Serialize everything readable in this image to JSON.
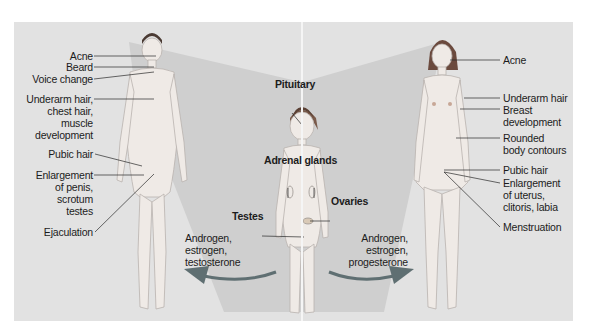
{
  "diagram": {
    "title": "",
    "male": {
      "labels": [
        {
          "id": "acne",
          "text": "Acne"
        },
        {
          "id": "beard",
          "text": "Beard"
        },
        {
          "id": "voice",
          "text": "Voice change"
        },
        {
          "id": "underarm",
          "text": "Underarm hair,\nchest hair,\nmuscle\ndevelopment"
        },
        {
          "id": "pubic",
          "text": "Pubic hair"
        },
        {
          "id": "enlargement",
          "text": "Enlargement\nof penis,\nscrotum\ntestes"
        },
        {
          "id": "ejaculation",
          "text": "Ejaculation"
        }
      ],
      "hormones": "Androgen,\nestrogen,\ntestosterone"
    },
    "child": {
      "labels": [
        {
          "id": "pituitary",
          "text": "Pituitary"
        },
        {
          "id": "adrenal",
          "text": "Adrenal glands"
        },
        {
          "id": "testes",
          "text": "Testes"
        },
        {
          "id": "ovaries",
          "text": "Ovaries"
        }
      ]
    },
    "female": {
      "labels": [
        {
          "id": "acne",
          "text": "Acne"
        },
        {
          "id": "underarm",
          "text": "Underarm hair"
        },
        {
          "id": "breast",
          "text": "Breast\ndevelopment"
        },
        {
          "id": "contours",
          "text": "Rounded\nbody contours"
        },
        {
          "id": "pubic",
          "text": "Pubic hair"
        },
        {
          "id": "enlargement",
          "text": "Enlargement\nof uterus,\nclitoris, labia"
        },
        {
          "id": "menstruation",
          "text": "Menstruation"
        }
      ],
      "hormones": "Androgen,\nestrogen,\nprogesterone"
    },
    "colors": {
      "background": "#e2e2e2",
      "wedge": "#cfcfcf",
      "arrow": "#5f6f72",
      "skin": "#efeae6",
      "hair": "#4a3a33",
      "leader": "#2a2a2a"
    }
  }
}
